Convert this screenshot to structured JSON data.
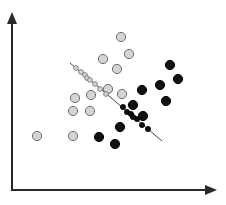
{
  "chart_data": {
    "type": "scatter",
    "title": "",
    "xlabel": "",
    "ylabel": "",
    "grid": false,
    "legend": null,
    "axes": {
      "origin": [
        12,
        190
      ],
      "x_axis_end": [
        217,
        190
      ],
      "y_axis_end": [
        12,
        12
      ],
      "color": "#2a2a2a"
    },
    "colors": {
      "class_a_fill": "#d4d4d4",
      "class_a_stroke": "#6e6e6e",
      "class_b_fill": "#111111",
      "class_b_stroke": "#000000",
      "line": "#444444"
    },
    "separator_line": {
      "x1": 70,
      "y1": 63,
      "x2": 162,
      "y2": 141
    },
    "series": [
      {
        "name": "class-a-grey",
        "marker": "large-grey-circle",
        "points": [
          [
            121,
            37
          ],
          [
            129,
            54
          ],
          [
            103,
            59
          ],
          [
            117,
            69
          ],
          [
            108,
            89
          ],
          [
            122,
            94
          ],
          [
            91,
            95
          ],
          [
            75,
            98
          ],
          [
            73,
            111
          ],
          [
            90,
            111
          ],
          [
            37,
            136
          ],
          [
            73,
            136
          ]
        ]
      },
      {
        "name": "class-b-black",
        "marker": "large-black-circle",
        "points": [
          [
            170,
            65
          ],
          [
            178,
            79
          ],
          [
            160,
            85
          ],
          [
            142,
            90
          ],
          [
            166,
            101
          ],
          [
            133,
            105
          ],
          [
            143,
            116
          ],
          [
            120,
            127
          ],
          [
            99,
            137
          ],
          [
            115,
            144
          ]
        ]
      },
      {
        "name": "projected-class-a",
        "marker": "small-grey-circle",
        "points": [
          [
            76,
            68
          ],
          [
            81,
            72
          ],
          [
            85,
            75
          ],
          [
            87,
            78
          ],
          [
            90,
            80
          ],
          [
            95,
            84
          ],
          [
            100,
            89
          ],
          [
            106,
            94
          ]
        ]
      },
      {
        "name": "projected-class-b",
        "marker": "small-black-circle",
        "points": [
          [
            123,
            107
          ],
          [
            127,
            112
          ],
          [
            131,
            114
          ],
          [
            133,
            117
          ],
          [
            137,
            119
          ],
          [
            142,
            125
          ],
          [
            148,
            129
          ]
        ]
      }
    ]
  }
}
